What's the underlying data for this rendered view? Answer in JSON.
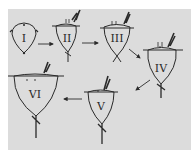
{
  "figure": {
    "title": "",
    "background_color": "#dcdcdc",
    "ink_color": "#2a2a2a",
    "stages": [
      {
        "id": "I",
        "label": "I"
      },
      {
        "id": "II",
        "label": "II"
      },
      {
        "id": "III",
        "label": "III"
      },
      {
        "id": "IV",
        "label": "IV"
      },
      {
        "id": "V",
        "label": "V"
      },
      {
        "id": "VI",
        "label": "VI"
      }
    ],
    "arrows": [
      {
        "from": "I",
        "to": "II"
      },
      {
        "from": "II",
        "to": "III"
      },
      {
        "from": "III",
        "to": "IV"
      },
      {
        "from": "IV",
        "to": "V"
      },
      {
        "from": "V",
        "to": "VI"
      }
    ]
  }
}
